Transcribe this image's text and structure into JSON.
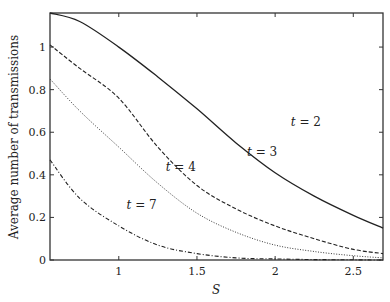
{
  "chart_data": {
    "type": "line",
    "title": "",
    "xlabel": "S",
    "ylabel": "Average number of transmissions",
    "xlim": [
      0.56,
      2.69
    ],
    "ylim": [
      0,
      1.16
    ],
    "xticks": [
      1,
      1.5,
      2,
      2.5
    ],
    "xtick_labels": [
      "1",
      "1.5",
      "2",
      "2.5"
    ],
    "yticks": [
      0,
      0.2,
      0.4,
      0.6,
      0.8,
      1
    ],
    "ytick_labels": [
      "0",
      "0.2",
      "0.4",
      "0.6",
      "0.8",
      "1"
    ],
    "grid": false,
    "legend": "inline curve labels",
    "x": [
      0.56,
      0.75,
      1.0,
      1.25,
      1.5,
      1.75,
      2.0,
      2.25,
      2.5,
      2.69
    ],
    "series": [
      {
        "name": "t = 2",
        "style": "solid",
        "values": [
          1.16,
          1.12,
          1.0,
          0.86,
          0.71,
          0.55,
          0.41,
          0.3,
          0.21,
          0.15
        ]
      },
      {
        "name": "t = 3",
        "style": "dashed",
        "values": [
          1.01,
          0.9,
          0.76,
          0.53,
          0.35,
          0.24,
          0.16,
          0.1,
          0.05,
          0.03
        ]
      },
      {
        "name": "t = 4",
        "style": "dotted",
        "values": [
          0.85,
          0.7,
          0.53,
          0.36,
          0.22,
          0.13,
          0.07,
          0.04,
          0.02,
          0.01
        ]
      },
      {
        "name": "t = 7",
        "style": "dashdot",
        "values": [
          0.47,
          0.29,
          0.16,
          0.07,
          0.03,
          0.01,
          0.005,
          0.002,
          0.001,
          0.0
        ]
      }
    ],
    "annotations": [
      {
        "text": "t = 2",
        "x": 2.1,
        "y": 0.63
      },
      {
        "text": "t = 3",
        "x": 1.82,
        "y": 0.49
      },
      {
        "text": "t = 4",
        "x": 1.3,
        "y": 0.42
      },
      {
        "text": "t = 7",
        "x": 1.05,
        "y": 0.24
      }
    ]
  }
}
